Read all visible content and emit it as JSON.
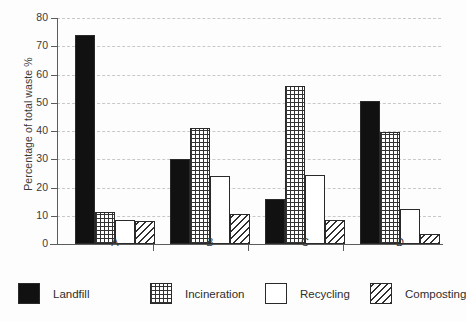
{
  "chart_data": {
    "type": "bar",
    "title": "",
    "subtitle": "",
    "xlabel": "",
    "ylabel": "Percentage of total waste %",
    "ylim": [
      0,
      80
    ],
    "yticks": [
      0,
      10,
      20,
      30,
      40,
      50,
      60,
      70,
      80
    ],
    "ytick_labels": [
      "0",
      "10",
      "20",
      "30",
      "40",
      "50",
      "60",
      "70",
      "80"
    ],
    "grid": true,
    "grid_style": "dashed-horizontal",
    "legend_position": "bottom",
    "categories": [
      "A",
      "B",
      "C",
      "D"
    ],
    "series": [
      {
        "name": "Landfill",
        "pattern": "solid-black",
        "color": "#111111",
        "values": [
          74,
          30,
          16,
          50.5
        ]
      },
      {
        "name": "Incineration",
        "pattern": "cross-hatch",
        "color": "#333333",
        "values": [
          11.5,
          41,
          56,
          39.8
        ]
      },
      {
        "name": "Recycling",
        "pattern": "white-open",
        "color": "#ffffff",
        "values": [
          8.5,
          24,
          24.5,
          12.5
        ]
      },
      {
        "name": "Composting",
        "pattern": "diagonal-hatch",
        "color": "#2f2f2f",
        "values": [
          8,
          10.5,
          8.5,
          3.5
        ]
      }
    ]
  },
  "axis": {
    "y_title": "Percentage of total waste %",
    "y_tick_0": "0",
    "y_tick_1": "10",
    "y_tick_2": "20",
    "y_tick_3": "30",
    "y_tick_4": "40",
    "y_tick_5": "50",
    "y_tick_6": "60",
    "y_tick_7": "70",
    "y_tick_8": "80",
    "x_group_a": "A",
    "x_group_b": "B",
    "x_group_c": "C",
    "x_group_d": "D"
  },
  "legend": {
    "items": [
      {
        "label": "Landfill"
      },
      {
        "label": "Incineration"
      },
      {
        "label": "Recycling"
      },
      {
        "label": "Composting"
      }
    ]
  }
}
